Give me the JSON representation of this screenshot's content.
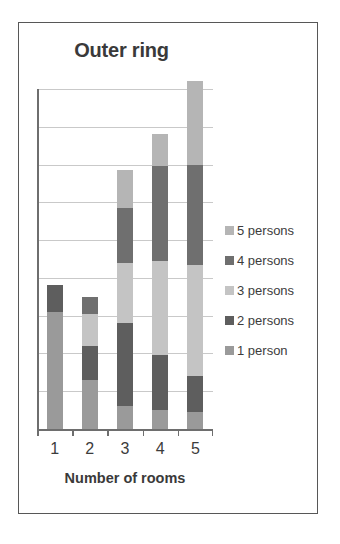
{
  "chart_data": {
    "type": "bar",
    "subtype": "stacked-bar",
    "title": "Outer ring",
    "xlabel": "Number of rooms",
    "ylabel": "",
    "categories": [
      "1",
      "2",
      "3",
      "4",
      "5"
    ],
    "grid": true,
    "gridline_count": 9,
    "legend_position": "right",
    "legend_order": [
      "5 persons",
      "4 persons",
      "3 persons",
      "2 persons",
      "1 person"
    ],
    "ylim": [
      0,
      9
    ],
    "yticks_labeled": false,
    "series": [
      {
        "name": "1 person",
        "color": "#9a9a9a",
        "values": [
          3.1,
          1.3,
          0.6,
          0.5,
          0.45
        ]
      },
      {
        "name": "2 persons",
        "color": "#5e5e5e",
        "values": [
          0.7,
          0.9,
          2.2,
          1.45,
          0.95
        ]
      },
      {
        "name": "3 persons",
        "color": "#c4c4c4",
        "values": [
          0,
          0.85,
          1.6,
          2.5,
          2.95
        ]
      },
      {
        "name": "4 persons",
        "color": "#6f6f6f",
        "values": [
          0,
          0.45,
          1.45,
          2.5,
          2.65
        ]
      },
      {
        "name": "5 persons",
        "color": "#b5b5b5",
        "values": [
          0,
          0,
          1.0,
          0.85,
          2.2
        ]
      }
    ],
    "totals": [
      3.8,
      3.5,
      6.85,
      7.8,
      9.2
    ]
  },
  "legend": {
    "items": [
      {
        "label": "5 persons",
        "color": "#b5b5b5"
      },
      {
        "label": "4 persons",
        "color": "#6f6f6f"
      },
      {
        "label": "3 persons",
        "color": "#c4c4c4"
      },
      {
        "label": "2 persons",
        "color": "#5e5e5e"
      },
      {
        "label": "1 person",
        "color": "#9a9a9a"
      }
    ]
  },
  "axis": {
    "x_tick_labels": [
      "1",
      "2",
      "3",
      "4",
      "5"
    ],
    "x_title": "Number of rooms"
  },
  "colors": {
    "frame_border": "#575757",
    "gridline": "#c9c9c9",
    "axis_line": "#6e6e6e",
    "text": "#3a3a3a",
    "background": "#ffffff"
  }
}
